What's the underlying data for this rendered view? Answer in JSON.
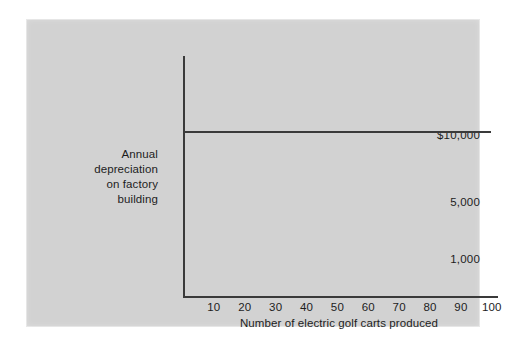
{
  "figure": {
    "panel_background": "#d2d2d2",
    "page_background": "#ffffff",
    "ink_color": "#3a3a3a",
    "text_color": "#1d1d1d"
  },
  "chart_data": {
    "type": "line",
    "title": "",
    "subtitle": "",
    "xlabel": "Number of electric golf carts produced",
    "ylabel": "Annual depreciation on factory building",
    "ylabel_lines": [
      "Annual",
      "depreciation",
      "on factory",
      "building"
    ],
    "x": [
      0,
      10,
      20,
      30,
      40,
      50,
      60,
      70,
      80,
      90,
      100
    ],
    "xtick_labels": [
      "10",
      "20",
      "30",
      "40",
      "50",
      "60",
      "70",
      "80",
      "90",
      "100"
    ],
    "xtick_values": [
      10,
      20,
      30,
      40,
      50,
      60,
      70,
      80,
      90,
      100
    ],
    "ytick_labels": [
      "$10,000",
      "5,000",
      "1,000"
    ],
    "ytick_values": [
      10000,
      5000,
      1000
    ],
    "xlim": [
      0,
      102
    ],
    "ylim": [
      0,
      14500
    ],
    "grid": false,
    "legend": null,
    "annotations": [],
    "series": [
      {
        "name": "Annual depreciation on factory building",
        "constant_value": 10000,
        "values": [
          10000,
          10000,
          10000,
          10000,
          10000,
          10000,
          10000,
          10000,
          10000,
          10000,
          10000
        ],
        "color": "#3a3a3a"
      }
    ]
  }
}
